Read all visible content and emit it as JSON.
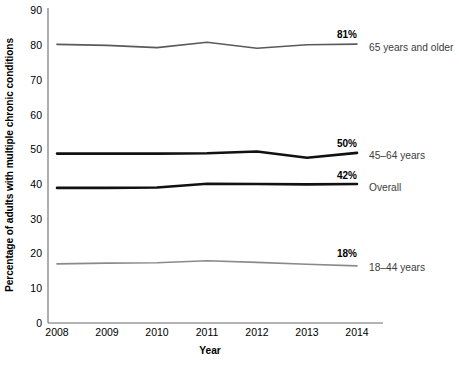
{
  "chart_data": {
    "type": "line",
    "title": "",
    "xlabel": "Year",
    "ylabel": "Percentage of adults with multiple chronic conditions",
    "x": [
      2008,
      2009,
      2010,
      2011,
      2012,
      2013,
      2014
    ],
    "xticklabels": [
      "2008",
      "2009",
      "2010",
      "2011",
      "2012",
      "2013",
      "2014"
    ],
    "yticklabels": [
      "0",
      "10",
      "20",
      "30",
      "40",
      "50",
      "60",
      "70",
      "80",
      "90"
    ],
    "yticks": [
      0,
      10,
      20,
      30,
      40,
      50,
      60,
      70,
      80,
      90
    ],
    "ylim": [
      0,
      90
    ],
    "xlim": [
      2008,
      2014
    ],
    "grid": false,
    "legend_position": "right-of-line-ends",
    "series": [
      {
        "name": "65 years and older",
        "label": "65 years and older",
        "end_value_label": "81%",
        "color": "#5a5a5a",
        "line_width": 1.6,
        "values": [
          79.6,
          79.3,
          78.7,
          80.2,
          78.5,
          79.5,
          79.7
        ]
      },
      {
        "name": "45-64 years",
        "label": "45–64 years",
        "end_value_label": "50%",
        "color": "#111111",
        "line_width": 2.6,
        "values": [
          48.4,
          48.4,
          48.4,
          48.5,
          49.0,
          47.2,
          48.6
        ]
      },
      {
        "name": "Overall",
        "label": "Overall",
        "end_value_label": "42%",
        "color": "#111111",
        "line_width": 2.6,
        "values": [
          38.6,
          38.6,
          38.7,
          39.8,
          39.7,
          39.6,
          39.7
        ]
      },
      {
        "name": "18-44 years",
        "label": "18–44 years",
        "end_value_label": "18%",
        "color": "#8a8a8a",
        "line_width": 1.6,
        "values": [
          16.9,
          17.1,
          17.2,
          17.8,
          17.3,
          16.8,
          16.3
        ]
      }
    ]
  },
  "axes": {
    "x_title": "Year",
    "y_title": "Percentage of adults with multiple chronic conditions"
  },
  "yticks": [
    {
      "label": "90"
    },
    {
      "label": "80"
    },
    {
      "label": "70"
    },
    {
      "label": "60"
    },
    {
      "label": "50"
    },
    {
      "label": "40"
    },
    {
      "label": "30"
    },
    {
      "label": "20"
    },
    {
      "label": "10"
    },
    {
      "label": "0"
    }
  ],
  "xticks": [
    {
      "label": "2008"
    },
    {
      "label": "2009"
    },
    {
      "label": "2010"
    },
    {
      "label": "2011"
    },
    {
      "label": "2012"
    },
    {
      "label": "2013"
    },
    {
      "label": "2014"
    }
  ],
  "annotations": [
    {
      "value": "81%",
      "label": "65 years and older"
    },
    {
      "value": "50%",
      "label": "45–64 years"
    },
    {
      "value": "42%",
      "label": "Overall"
    },
    {
      "value": "18%",
      "label": "18–44 years"
    }
  ],
  "colors": {
    "axis": "#6b6b6b",
    "text": "#000000",
    "series_label": "#3c3c3c",
    "line_dark": "#111111",
    "line_gray": "#5a5a5a",
    "line_light_gray": "#8a8a8a",
    "background": "#ffffff"
  }
}
